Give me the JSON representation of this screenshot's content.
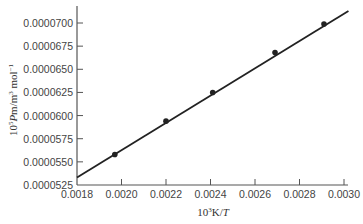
{
  "chart_data": {
    "type": "scatter",
    "title": "",
    "xlabel": "10^3K/T",
    "ylabel": "10^5Pm/m^3 mol^-1",
    "xlim": [
      0.0018,
      0.003
    ],
    "ylim": [
      5.25e-05,
      7.12e-05
    ],
    "x_ticks": [
      "0.0018",
      "0.0020",
      "0.0022",
      "0.0024",
      "0.0026",
      "0.0028",
      "0.0030"
    ],
    "y_ticks": [
      "0.0000525",
      "0.0000550",
      "0.0000575",
      "0.0000600",
      "0.0000625",
      "0.0000650",
      "0.0000675",
      "0.0000700"
    ],
    "grid": false,
    "legend": null,
    "series": [
      {
        "name": "data",
        "marker": "filled-circle",
        "x": [
          0.00197,
          0.0022,
          0.00241,
          0.00269,
          0.00291
        ],
        "y": [
          5.58e-05,
          5.94e-05,
          6.25e-05,
          6.68e-05,
          6.99e-05
        ]
      }
    ],
    "fit_line": {
      "type": "linear",
      "x_start": 0.0018,
      "y_start": 5.33e-05,
      "x_end": 0.00302,
      "y_end": 7.13e-05
    },
    "colors": {
      "line": "#222222",
      "marker": "#222222",
      "axis": "#555555"
    }
  }
}
